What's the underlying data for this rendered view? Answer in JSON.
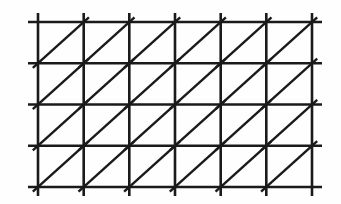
{
  "figure": {
    "width": 341,
    "height": 204,
    "background_color": "#fefefe",
    "line_color": "#1a1a1a"
  },
  "grid": {
    "vertical_line_count": 7,
    "horizontal_line_count": 5,
    "cell_columns": 6,
    "cell_rows": 4,
    "diagonal_count": 24,
    "diagonal_direction": "bottom-left-to-top-right",
    "vertical_x": [
      38,
      83.7,
      129.3,
      175,
      220.7,
      266.3,
      312
    ],
    "horizontal_y": [
      22,
      63.25,
      104.5,
      145.75,
      187
    ],
    "vertical_span_y": [
      13,
      196
    ],
    "horizontal_span_x": [
      28,
      322
    ],
    "stroke_width_main": 2.6,
    "stroke_width_diagonal": 2.4,
    "diagonal_overshoot": 7
  }
}
